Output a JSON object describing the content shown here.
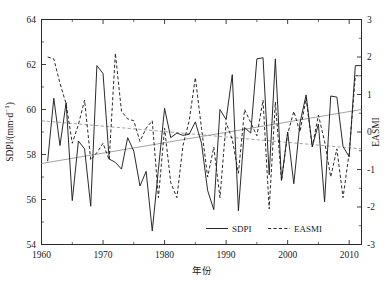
{
  "chart_data": {
    "type": "line",
    "title": "",
    "xlabel": "年份",
    "ylabel": "SDPI/(mm·d⁻¹)",
    "y2label": "EASMI",
    "xlim": [
      1960,
      2012
    ],
    "ylim": [
      54,
      64
    ],
    "y2lim": [
      -3,
      3
    ],
    "xticks": [
      1960,
      1970,
      1980,
      1990,
      2000,
      2010
    ],
    "xticklabels": [
      "1960",
      "1970",
      "1980",
      "1990",
      "2000",
      "2010"
    ],
    "xminorticks": [
      1965,
      1975,
      1985,
      1995,
      2005
    ],
    "yticks": [
      54,
      56,
      58,
      60,
      62,
      64
    ],
    "yticklabels": [
      "54",
      "56",
      "58",
      "60",
      "62",
      "64"
    ],
    "y2ticks": [
      -3,
      -2,
      -1,
      0,
      1,
      2,
      3
    ],
    "y2ticklabels": [
      "-3",
      "-2",
      "-1",
      "0",
      "1",
      "2",
      "3"
    ],
    "grid": false,
    "legend_position": "inside-bottom-center",
    "x": [
      1961,
      1962,
      1963,
      1964,
      1965,
      1966,
      1967,
      1968,
      1969,
      1970,
      1971,
      1972,
      1973,
      1974,
      1975,
      1976,
      1977,
      1978,
      1979,
      1980,
      1981,
      1982,
      1983,
      1984,
      1985,
      1986,
      1987,
      1988,
      1989,
      1990,
      1991,
      1992,
      1993,
      1994,
      1995,
      1996,
      1997,
      1998,
      1999,
      2000,
      2001,
      2002,
      2003,
      2004,
      2005,
      2006,
      2007,
      2008,
      2009,
      2010,
      2011,
      2012
    ],
    "series": [
      {
        "name": "SDPI",
        "style": "solid",
        "color": "#1f1f1f",
        "axis": "left",
        "values": [
          57.7,
          60.5,
          58.4,
          60.3,
          55.95,
          58.6,
          58.25,
          55.7,
          61.95,
          61.6,
          57.8,
          57.65,
          57.35,
          58.75,
          58.15,
          56.6,
          57.25,
          54.6,
          57.35,
          60.05,
          58.75,
          58.95,
          58.85,
          58.9,
          59.45,
          58.5,
          56.4,
          55.55,
          60.0,
          59.55,
          61.55,
          55.5,
          59.2,
          58.95,
          62.25,
          62.3,
          57.1,
          62.25,
          56.85,
          59.0,
          56.7,
          59.4,
          60.65,
          58.35,
          59.35,
          55.9,
          60.6,
          60.55,
          58.35,
          57.9,
          61.95,
          61.95
        ]
      },
      {
        "name": "EASMI",
        "style": "dashed",
        "color": "#1f1f1f",
        "axis": "right",
        "values": [
          2.0,
          1.95,
          1.3,
          0.75,
          -0.3,
          0.2,
          0.85,
          -0.75,
          -0.55,
          -0.3,
          -0.75,
          2.1,
          0.55,
          0.35,
          0.3,
          -0.25,
          0.1,
          0.3,
          -1.75,
          0.1,
          -1.35,
          -1.75,
          -0.35,
          0.3,
          1.45,
          0.1,
          -1.2,
          -0.4,
          -1.75,
          0.25,
          -0.2,
          -1.1,
          0.6,
          0.25,
          -0.1,
          0.85,
          -2.05,
          0.8,
          -1.3,
          -0.05,
          0.55,
          0.0,
          0.9,
          -0.4,
          0.45,
          -0.25,
          -1.2,
          -0.45,
          -1.75,
          -0.55,
          1.5,
          1.5
        ]
      }
    ],
    "trend_lines": [
      {
        "name": "SDPI-trend",
        "axis": "left",
        "style": "solid",
        "x": [
          1960,
          2012
        ],
        "y": [
          57.6,
          60.0
        ]
      },
      {
        "name": "EASMI-trend",
        "axis": "right",
        "style": "dashed",
        "x": [
          1960,
          2012
        ],
        "y": [
          0.3,
          -0.45
        ]
      }
    ]
  },
  "legend": {
    "items": [
      {
        "label": "SDPI",
        "style": "solid"
      },
      {
        "label": "EASMI",
        "style": "dashed"
      }
    ]
  },
  "axes": {
    "y_left_label": "SDPI/(mm·d⁻¹)",
    "y_right_label": "EASMI",
    "x_label": "年份"
  }
}
